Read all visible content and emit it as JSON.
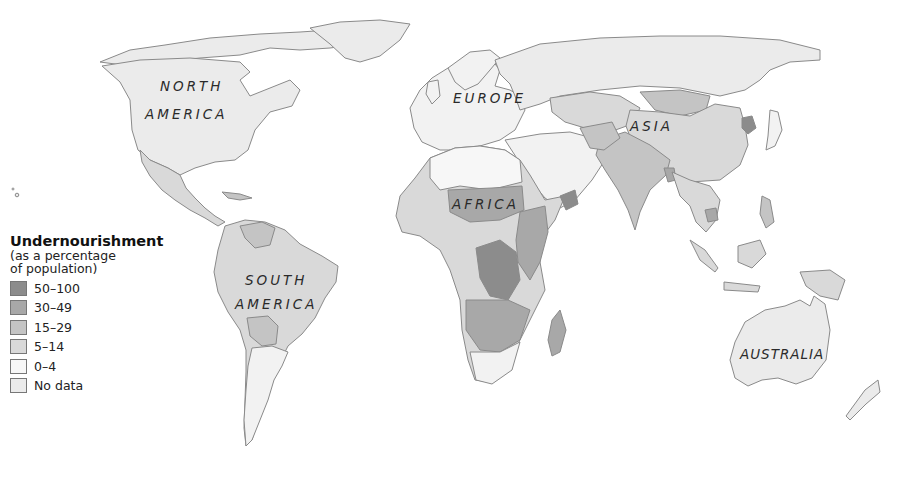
{
  "map": {
    "type": "choropleth-world",
    "title": "Undernourishment",
    "regions": [
      {
        "id": "north-america",
        "label_line1": "NORTH",
        "label_line2": "AMERICA"
      },
      {
        "id": "south-america",
        "label_line1": "SOUTH",
        "label_line2": "AMERICA"
      },
      {
        "id": "europe",
        "label_line1": "EUROPE"
      },
      {
        "id": "africa",
        "label_line1": "AFRICA"
      },
      {
        "id": "asia",
        "label_line1": "ASIA"
      },
      {
        "id": "australia",
        "label_line1": "AUSTRALIA"
      }
    ]
  },
  "legend": {
    "title": "Undernourishment",
    "subtitle_line1": "(as a percentage",
    "subtitle_line2": "of population)",
    "items": [
      {
        "label": "50–100",
        "color": "#8c8c8c"
      },
      {
        "label": "30–49",
        "color": "#a8a8a8"
      },
      {
        "label": "15–29",
        "color": "#c4c4c4"
      },
      {
        "label": "5–14",
        "color": "#d9d9d9"
      },
      {
        "label": "0–4",
        "color": "#f7f7f7"
      },
      {
        "label": "No data",
        "color": "#ebebeb"
      }
    ]
  }
}
